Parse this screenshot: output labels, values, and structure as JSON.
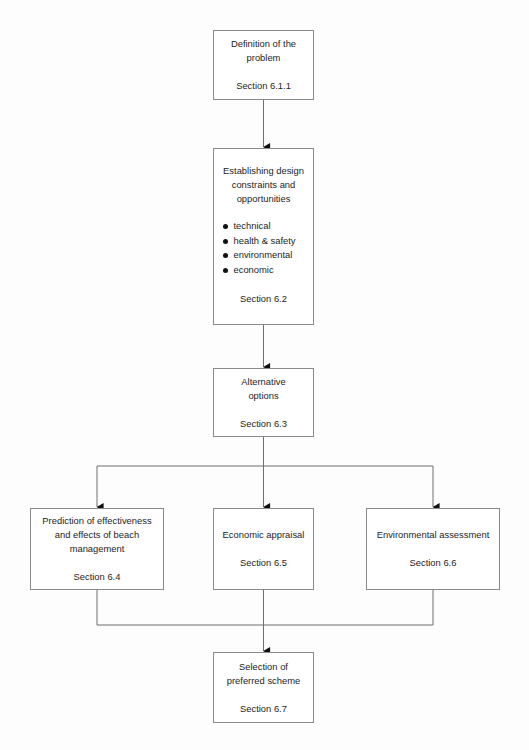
{
  "diagram": {
    "line_color": "#6e6e6e",
    "box_border_color": "#8a8a8a",
    "background_color": "#fdfdfd",
    "text_color": "#1d1d1d"
  },
  "nodes": [
    {
      "id": "definition",
      "title": "Definition of the\nproblem",
      "section": "Section 6.1.1",
      "x": 213,
      "y": 30,
      "w": 101,
      "h": 70
    },
    {
      "id": "constraints",
      "title": "Establishing design\nconstraints and\nopportunities",
      "bullets": [
        "technical",
        "health & safety",
        "environmental",
        "economic"
      ],
      "section": "Section 6.2",
      "x": 213,
      "y": 148,
      "w": 101,
      "h": 177
    },
    {
      "id": "alternatives",
      "title": "Alternative\noptions",
      "section": "Section 6.3",
      "x": 213,
      "y": 368,
      "w": 101,
      "h": 69
    },
    {
      "id": "prediction",
      "title": "Prediction of effectiveness\nand effects of beach\nmanagement",
      "section": "Section 6.4",
      "x": 30,
      "y": 508,
      "w": 134,
      "h": 82
    },
    {
      "id": "economic",
      "title": "Economic appraisal",
      "section": "Section 6.5",
      "x": 213,
      "y": 508,
      "w": 101,
      "h": 82
    },
    {
      "id": "environmental",
      "title": "Environmental assessment",
      "section": "Section 6.6",
      "x": 366,
      "y": 508,
      "w": 134,
      "h": 82
    },
    {
      "id": "selection",
      "title": "Selection of\npreferred scheme",
      "section": "Section 6.7",
      "x": 213,
      "y": 652,
      "w": 101,
      "h": 71
    }
  ],
  "connectors": {
    "branch_bar_y": 466,
    "merge_bar_y": 625,
    "left_branch_x": 97,
    "center_branch_x": 263,
    "right_branch_x": 433
  }
}
